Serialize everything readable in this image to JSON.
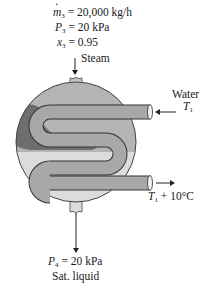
{
  "inlet_steam": {
    "mass_flow_symbol": "m",
    "mass_flow_sub": "3",
    "mass_flow_value": " = 20,000 kg/h",
    "pressure_symbol": "P",
    "pressure_sub": "3",
    "pressure_value": " = 20 kPa",
    "quality_symbol": "x",
    "quality_sub": "3",
    "quality_value": " = 0.95",
    "label": "Steam"
  },
  "water_inlet": {
    "label": "Water",
    "temp_symbol": "T",
    "temp_sub": "1"
  },
  "water_outlet": {
    "temp_symbol": "T",
    "temp_sub": "1",
    "temp_suffix": " + 10°C"
  },
  "outlet_liquid": {
    "pressure_symbol": "P",
    "pressure_sub": "4",
    "pressure_value": " = 20 kPa",
    "state": "Sat. liquid"
  },
  "colors": {
    "shell_vapor": "#b4b4b4",
    "shell_liquid": "#dcdcdc",
    "condensate": "#6e6e6e",
    "tube": "#a6a6a6",
    "outline": "#333333"
  }
}
